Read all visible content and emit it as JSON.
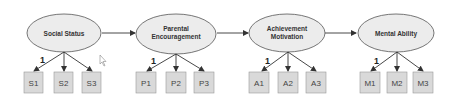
{
  "diagram": {
    "type": "structural-equation-model",
    "colors": {
      "ellipse_fill": "#ececec",
      "ellipse_stroke": "#555555",
      "box_fill": "#d9d9d9",
      "box_stroke": "#999999",
      "arrow": "#333333"
    },
    "latents": [
      {
        "id": "social_status",
        "lines": [
          "Social Status"
        ],
        "indicators": [
          "S1",
          "S2",
          "S3"
        ],
        "loading_label": "1"
      },
      {
        "id": "parental_encouragement",
        "lines": [
          "Parental",
          "Encouragement"
        ],
        "indicators": [
          "P1",
          "P2",
          "P3"
        ],
        "loading_label": "1"
      },
      {
        "id": "achievement_motivation",
        "lines": [
          "Achievement",
          "Motivation"
        ],
        "indicators": [
          "A1",
          "A2",
          "A3"
        ],
        "loading_label": "1"
      },
      {
        "id": "mental_ability",
        "lines": [
          "Mental Ability"
        ],
        "indicators": [
          "M1",
          "M2",
          "M3"
        ],
        "loading_label": "1"
      }
    ],
    "paths": [
      {
        "from": "Social Status",
        "to": "Parental Encouragement"
      },
      {
        "from": "Parental Encouragement",
        "to": "Achievement Motivation"
      },
      {
        "from": "Achievement Motivation",
        "to": "Mental Ability"
      }
    ]
  }
}
